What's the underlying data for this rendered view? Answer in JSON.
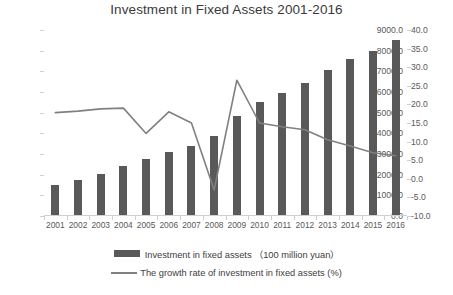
{
  "chart_data": {
    "type": "bar",
    "title": "Investment in Fixed Assets 2001-2016",
    "xlabel": "",
    "ylabel": "",
    "grid": false,
    "legend_position": "bottom",
    "categories": [
      "2001",
      "2002",
      "2003",
      "2004",
      "2005",
      "2006",
      "2007",
      "2008",
      "2009",
      "2010",
      "2011",
      "2012",
      "2013",
      "2014",
      "2015",
      "2016"
    ],
    "x_tick_labels": [
      "2001",
      "2002",
      "2003",
      "2004",
      "2005",
      "2006",
      "2007",
      "2008",
      "2009",
      "2010",
      "2011",
      "2012",
      "2013",
      "2014",
      "2015",
      "2016"
    ],
    "y_left_axis": {
      "label": "",
      "ylim": [
        0.0,
        9000.0
      ],
      "ticks": [
        0.0,
        1000.0,
        2000.0,
        3000.0,
        4000.0,
        5000.0,
        6000.0,
        7000.0,
        8000.0,
        9000.0
      ],
      "tick_labels": [
        "0.0",
        "1000.0",
        "2000.0",
        "3000.0",
        "4000.0",
        "5000.0",
        "6000.0",
        "7000.0",
        "8000.0",
        "9000.0"
      ]
    },
    "y_right_axis": {
      "label": "",
      "ylim": [
        -10.0,
        40.0
      ],
      "ticks": [
        -10.0,
        -5.0,
        0.0,
        5.0,
        10.0,
        15.0,
        20.0,
        25.0,
        30.0,
        35.0,
        40.0
      ],
      "tick_labels": [
        "-10.0",
        "-5.0",
        "0.0",
        "5.0",
        "10.0",
        "15.0",
        "20.0",
        "25.0",
        "30.0",
        "35.0",
        "40.0"
      ]
    },
    "series": [
      {
        "name": "Investment in fixed assets （100 million yuan）",
        "type": "bar",
        "axis": "left",
        "color": "#595959",
        "values": [
          1500,
          1750,
          2050,
          2400,
          2750,
          3100,
          3400,
          3850,
          4850,
          5500,
          5950,
          6450,
          7050,
          7600,
          8000,
          8500
        ]
      },
      {
        "name": "The growth rate of investment in fixed assets (%)",
        "type": "line",
        "axis": "right",
        "color": "#808080",
        "values": [
          17.8,
          18.2,
          18.8,
          19.0,
          12.2,
          18.0,
          15.0,
          -3.0,
          26.5,
          15.0,
          14.0,
          13.2,
          10.5,
          8.8,
          7.0,
          6.2
        ]
      }
    ]
  },
  "legend": {
    "items": [
      {
        "label": "Investment in fixed assets （100 million yuan）",
        "marker": "bar-swatch"
      },
      {
        "label": "The growth rate of investment in fixed assets (%)",
        "marker": "line-swatch"
      }
    ]
  },
  "colors": {
    "bar": "#595959",
    "line": "#808080",
    "axis": "#d0d0d0",
    "text": "#404040",
    "background": "#ffffff"
  }
}
